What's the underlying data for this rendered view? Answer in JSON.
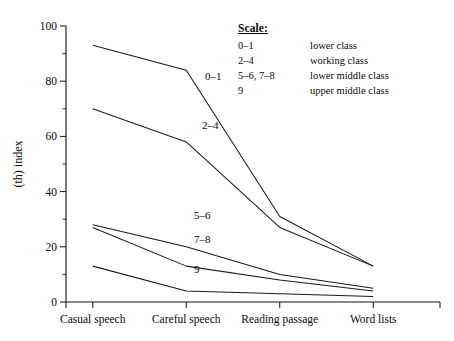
{
  "chart_data": {
    "type": "line",
    "title": "",
    "xlabel": "",
    "ylabel": "(th) index",
    "categories": [
      "Casual speech",
      "Careful speech",
      "Reading passage",
      "Word lists"
    ],
    "ylim": [
      0,
      100
    ],
    "xlim": [
      0,
      3
    ],
    "grid": false,
    "legend_position": "top-right",
    "ytick_labels": [
      "0",
      "20",
      "40",
      "60",
      "80",
      "100"
    ],
    "ytick_values": [
      0,
      20,
      40,
      60,
      80,
      100
    ],
    "yminor_values": [
      10,
      30,
      50,
      70,
      90
    ],
    "series": [
      {
        "name": "0–1",
        "values": [
          93,
          84,
          31,
          13
        ]
      },
      {
        "name": "2–4",
        "values": [
          70,
          58,
          27,
          13
        ]
      },
      {
        "name": "5–6",
        "values": [
          28,
          20,
          10,
          5
        ]
      },
      {
        "name": "7–8",
        "values": [
          27,
          13,
          8,
          4
        ]
      },
      {
        "name": "9",
        "values": [
          13,
          4,
          3,
          2
        ]
      }
    ],
    "series_label_positions": [
      {
        "name": "0–1",
        "x": 205,
        "y": 80
      },
      {
        "name": "2–4",
        "x": 202,
        "y": 129
      },
      {
        "name": "5–6",
        "x": 194,
        "y": 219
      },
      {
        "name": "7–8",
        "x": 194,
        "y": 243
      },
      {
        "name": "9",
        "x": 194,
        "y": 273
      }
    ]
  },
  "legend": {
    "title": "Scale:",
    "rows": [
      {
        "range": "0–1",
        "label": "lower class"
      },
      {
        "range": "2–4",
        "label": "working class"
      },
      {
        "range": "5–6, 7–8",
        "label": "lower middle class"
      },
      {
        "range": "9",
        "label": "upper middle class"
      }
    ]
  },
  "colors": {
    "line": "#1a1a1a",
    "axis": "#111111",
    "background": "#ffffff",
    "text": "#0a0a0a"
  }
}
